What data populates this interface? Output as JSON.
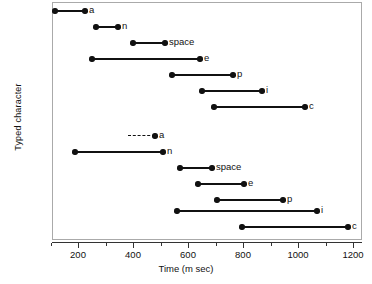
{
  "chart_data": {
    "type": "bar",
    "chart_style": "interval-timeline",
    "title": "",
    "xlabel": "Time (m sec)",
    "ylabel": "Typed character",
    "xlim": [
      0,
      1320
    ],
    "ylim": [
      0,
      15
    ],
    "grid": false,
    "legend": "none",
    "x_ticks_major": [
      200,
      400,
      600,
      800,
      1000,
      1200
    ],
    "x_tick_labels": [
      "200",
      "400",
      "600",
      "800",
      "1000",
      "1200"
    ],
    "x_ticks_minor": [
      100,
      300,
      500,
      700,
      900,
      1100,
      1300
    ],
    "y_categories": [
      "a",
      "n",
      "space",
      "e",
      "p",
      "i",
      "c",
      "a",
      "n",
      "space",
      "e",
      "p",
      "i",
      "c"
    ],
    "series": [
      {
        "name": "group-1",
        "intervals": [
          {
            "label": "a",
            "start": 116,
            "end": 225,
            "style": "solid"
          },
          {
            "label": "n",
            "start": 265,
            "end": 345,
            "style": "solid"
          },
          {
            "label": "space",
            "start": 400,
            "end": 516,
            "style": "solid"
          },
          {
            "label": "e",
            "start": 251,
            "end": 644,
            "style": "solid"
          },
          {
            "label": "p",
            "start": 542,
            "end": 764,
            "style": "solid"
          },
          {
            "label": "i",
            "start": 651,
            "end": 869,
            "style": "solid"
          },
          {
            "label": "c",
            "start": 695,
            "end": 1025,
            "style": "solid"
          }
        ]
      },
      {
        "name": "group-2",
        "intervals": [
          {
            "label": "a",
            "start": 382,
            "end": 480,
            "style": "dashed"
          },
          {
            "label": "n",
            "start": 189,
            "end": 509,
            "style": "solid"
          },
          {
            "label": "space",
            "start": 571,
            "end": 687,
            "style": "solid"
          },
          {
            "label": "e",
            "start": 636,
            "end": 804,
            "style": "solid"
          },
          {
            "label": "p",
            "start": 705,
            "end": 945,
            "style": "solid"
          },
          {
            "label": "i",
            "start": 560,
            "end": 1069,
            "style": "solid"
          },
          {
            "label": "c",
            "start": 796,
            "end": 1182,
            "style": "solid"
          }
        ]
      }
    ],
    "colors": {
      "marker": "#111111",
      "line": "#111111",
      "axis": "#333333",
      "frame": "#aaaaaa",
      "background": "#ffffff"
    }
  }
}
